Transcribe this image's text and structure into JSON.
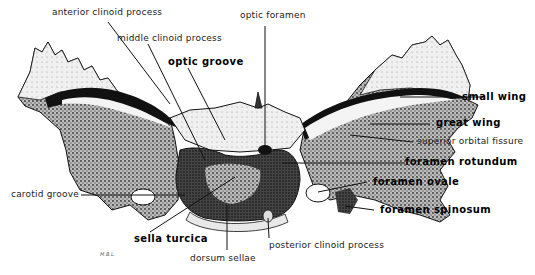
{
  "figure": {
    "signature": "M.B.L."
  },
  "labels": {
    "anterior_clinoid_process": "anterior clinoid process",
    "middle_clinoid_process": "middle clinoid process",
    "optic_groove": "optic groove",
    "optic_foramen": "optic foramen",
    "small_wing": "small wing",
    "great_wing": "great wing",
    "superior_orbital_fissure": "superior orbital fissure",
    "foramen_rotundum": "foramen rotundum",
    "foramen_ovale": "foramen ovale",
    "foramen_spinosum": "foramen spinosum",
    "carotid_groove": "carotid groove",
    "sella_turcica": "sella turcica",
    "dorsum_sellae": "dorsum sellae",
    "posterior_clinoid_process": "posterior clinoid process"
  },
  "colors": {
    "ink": "#111111",
    "stipple_dark": "#2a2a2a",
    "stipple_mid": "#7a7a7a",
    "bone_light": "#e8e8e8",
    "background": "#ffffff"
  }
}
